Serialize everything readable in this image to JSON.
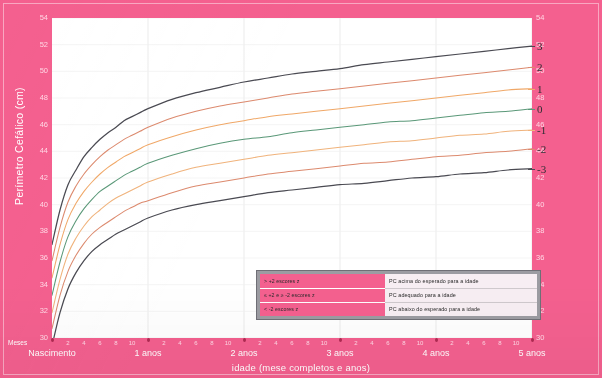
{
  "chart_data": {
    "type": "line",
    "title": "",
    "xlabel": "idade (mese completos e anos)",
    "ylabel": "Perímetro Cefálico (cm)",
    "xlim": [
      0,
      60
    ],
    "ylim": [
      30,
      54
    ],
    "grid": true,
    "legend_position": "bottom-right",
    "x_unit_label": "Meses",
    "y_ticks": [
      30,
      32,
      34,
      36,
      38,
      40,
      42,
      44,
      46,
      48,
      50,
      52,
      54
    ],
    "y_tick_labels": [
      "30",
      "32",
      "34",
      "36",
      "38",
      "40",
      "42",
      "44",
      "46",
      "48",
      "50",
      "52",
      "54"
    ],
    "x_year_ticks": [
      0,
      12,
      24,
      36,
      48,
      60
    ],
    "x_year_labels": [
      "Nascimento",
      "1 anos",
      "2 anos",
      "3 anos",
      "4 anos",
      "5 anos"
    ],
    "x_month_labels": [
      "2",
      "4",
      "6",
      "8",
      "10"
    ],
    "x": [
      0,
      1,
      2,
      3,
      4,
      5,
      6,
      7,
      8,
      9,
      10,
      11,
      12,
      15,
      18,
      21,
      24,
      27,
      30,
      33,
      36,
      39,
      42,
      45,
      48,
      51,
      54,
      57,
      60
    ],
    "series": [
      {
        "name": "3",
        "label": "3",
        "color": "#4a4a52",
        "values": [
          37.0,
          39.6,
          41.5,
          42.6,
          43.6,
          44.3,
          44.9,
          45.4,
          45.8,
          46.3,
          46.6,
          46.9,
          47.2,
          47.9,
          48.4,
          48.8,
          49.2,
          49.5,
          49.8,
          50.0,
          50.2,
          50.5,
          50.7,
          50.9,
          51.1,
          51.3,
          51.5,
          51.7,
          51.9
        ]
      },
      {
        "name": "2",
        "label": "2",
        "color": "#dc8a6e",
        "values": [
          35.8,
          38.3,
          40.2,
          41.4,
          42.3,
          43.0,
          43.6,
          44.1,
          44.5,
          44.9,
          45.2,
          45.5,
          45.8,
          46.5,
          47.0,
          47.4,
          47.7,
          48.0,
          48.3,
          48.5,
          48.7,
          48.9,
          49.1,
          49.3,
          49.5,
          49.7,
          49.9,
          50.1,
          50.3
        ]
      },
      {
        "name": "1",
        "label": "1",
        "color": "#f0a868",
        "values": [
          34.5,
          37.0,
          38.9,
          40.1,
          41.0,
          41.7,
          42.3,
          42.8,
          43.2,
          43.6,
          43.9,
          44.2,
          44.5,
          45.1,
          45.6,
          46.0,
          46.3,
          46.6,
          46.8,
          47.0,
          47.2,
          47.4,
          47.6,
          47.8,
          48.0,
          48.2,
          48.4,
          48.6,
          48.7
        ]
      },
      {
        "name": "0",
        "label": "0",
        "color": "#5a9878",
        "values": [
          33.2,
          35.7,
          37.6,
          38.8,
          39.7,
          40.4,
          41.0,
          41.4,
          41.8,
          42.2,
          42.5,
          42.8,
          43.1,
          43.7,
          44.2,
          44.6,
          44.9,
          45.1,
          45.4,
          45.6,
          45.8,
          46.0,
          46.2,
          46.3,
          46.5,
          46.7,
          46.9,
          47.0,
          47.2
        ]
      },
      {
        "name": "-1",
        "label": "-1",
        "color": "#f0b37c",
        "values": [
          31.9,
          34.4,
          36.3,
          37.5,
          38.4,
          39.1,
          39.6,
          40.1,
          40.5,
          40.8,
          41.1,
          41.4,
          41.7,
          42.3,
          42.8,
          43.1,
          43.4,
          43.7,
          43.9,
          44.1,
          44.3,
          44.5,
          44.7,
          44.8,
          45.0,
          45.2,
          45.3,
          45.5,
          45.6
        ]
      },
      {
        "name": "-2",
        "label": "-2",
        "color": "#dc8a6e",
        "values": [
          30.7,
          33.2,
          35.0,
          36.2,
          37.1,
          37.8,
          38.3,
          38.7,
          39.1,
          39.5,
          39.8,
          40.1,
          40.3,
          40.9,
          41.4,
          41.7,
          42.0,
          42.3,
          42.5,
          42.7,
          42.9,
          43.1,
          43.2,
          43.4,
          43.6,
          43.7,
          43.9,
          44.0,
          44.2
        ]
      },
      {
        "name": "-3",
        "label": "-3",
        "color": "#4a4a52",
        "values": [
          29.4,
          31.9,
          33.7,
          34.9,
          35.8,
          36.5,
          37.0,
          37.4,
          37.8,
          38.1,
          38.4,
          38.7,
          39.0,
          39.6,
          40.0,
          40.3,
          40.6,
          40.9,
          41.1,
          41.3,
          41.5,
          41.6,
          41.8,
          42.0,
          42.1,
          42.3,
          42.4,
          42.6,
          42.7
        ]
      }
    ]
  },
  "axis": {
    "y_title": "Perímetro Cefálico (cm)",
    "x_title": "idade (mese completos e anos)",
    "months_label": "Meses"
  },
  "legend": {
    "rows": [
      {
        "category": "> +2 escores z",
        "description": "PC acima do esperado para a idade"
      },
      {
        "category": "≤ +2 e ≥ -2 escores z",
        "description": "PC adequado para a idade"
      },
      {
        "category": "< -2 escores z",
        "description": "PC abaixo do esperado para a idade"
      }
    ]
  },
  "colors": {
    "frame_pink": "#f4608f",
    "plot_background": "#ffffff",
    "grid": "#e6e6e6",
    "z3": "#4a4a52",
    "z2": "#dc8a6e",
    "z1": "#f0a868",
    "z0": "#5a9878",
    "legend_border": "#6f6f76",
    "legend_fill": "#9c9ca2"
  }
}
